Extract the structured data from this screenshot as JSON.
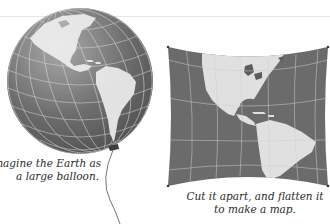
{
  "figure": {
    "balloon_panel": {
      "caption_lines": [
        "Imagine the Earth as",
        "a large balloon."
      ],
      "graphic": "globe-balloon-americas"
    },
    "map_panel": {
      "caption_lines": [
        "Cut it apart, and flatten it",
        "to make a map."
      ],
      "graphic": "flattened-map-americas"
    }
  },
  "colors": {
    "ocean": "#6e6e6e",
    "land": "#e4e4e4",
    "graticule": "#cfcfcf",
    "caption_text": "#2b2b2b",
    "rule": "#e6e6e6"
  }
}
